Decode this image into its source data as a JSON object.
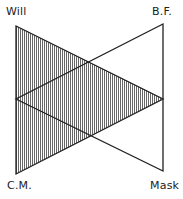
{
  "diagram": {
    "labels": {
      "top_left": "Will",
      "top_right": "B.F.",
      "bottom_left": "C.M.",
      "bottom_right": "Mask"
    },
    "shaded_triangle": {
      "vertices": [
        "Will",
        "C.M.",
        "right-midpoint"
      ],
      "fill": "vertical-hatching"
    },
    "unshaded_triangle": {
      "vertices": [
        "B.F.",
        "Mask",
        "left-midpoint"
      ],
      "fill": "none"
    },
    "colors": {
      "stroke": "#222222",
      "hatch": "#555555",
      "background": "#ffffff"
    }
  }
}
